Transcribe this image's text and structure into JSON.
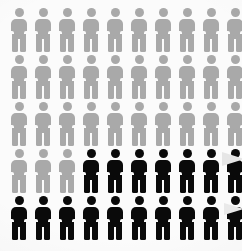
{
  "chart_data": {
    "type": "pictogram",
    "title": "",
    "subtitle": "",
    "xlabel": "",
    "ylabel": "",
    "unit_label": "person",
    "icon": "person-icon",
    "rows": 5,
    "columns": 10,
    "total_units": 50,
    "highlighted_units": 17,
    "unhighlighted_units": 33,
    "highlighted_percent": 34,
    "unhighlighted_percent": 66,
    "fill_order": "bottom-right",
    "legend": [],
    "annotations": [],
    "colors": {
      "background": "#fbfbfb",
      "highlighted": "#0a0a0a",
      "unhighlighted": "#a9a9a9",
      "callout": "#e6e6e6"
    },
    "series": [
      {
        "name": "Highlighted",
        "value": 17,
        "color": "#0a0a0a"
      },
      {
        "name": "Remaining",
        "value": 33,
        "color": "#a9a9a9"
      }
    ],
    "grid": [
      [
        "gray",
        "gray",
        "gray",
        "gray",
        "gray",
        "gray",
        "gray",
        "gray",
        "gray",
        "gray"
      ],
      [
        "gray",
        "gray",
        "gray",
        "gray",
        "gray",
        "gray",
        "gray",
        "gray",
        "gray",
        "gray"
      ],
      [
        "gray",
        "gray",
        "gray",
        "gray",
        "gray",
        "gray",
        "gray",
        "gray",
        "gray",
        "gray"
      ],
      [
        "gray",
        "gray",
        "gray",
        "black",
        "black",
        "black",
        "black",
        "black",
        "black",
        "black"
      ],
      [
        "black",
        "black",
        "black",
        "black",
        "black",
        "black",
        "black",
        "black",
        "black",
        "black"
      ]
    ],
    "row_tops": [
      8,
      55,
      102,
      149,
      196
    ],
    "column_lefts": [
      11,
      35,
      59,
      83,
      107,
      131,
      155,
      179,
      203,
      227
    ]
  },
  "callouts": [
    {
      "name": "callout-wedge-upper",
      "target_row": 4,
      "target_column": 10
    },
    {
      "name": "callout-wedge-lower",
      "target_row": 5,
      "target_column": 10
    }
  ]
}
